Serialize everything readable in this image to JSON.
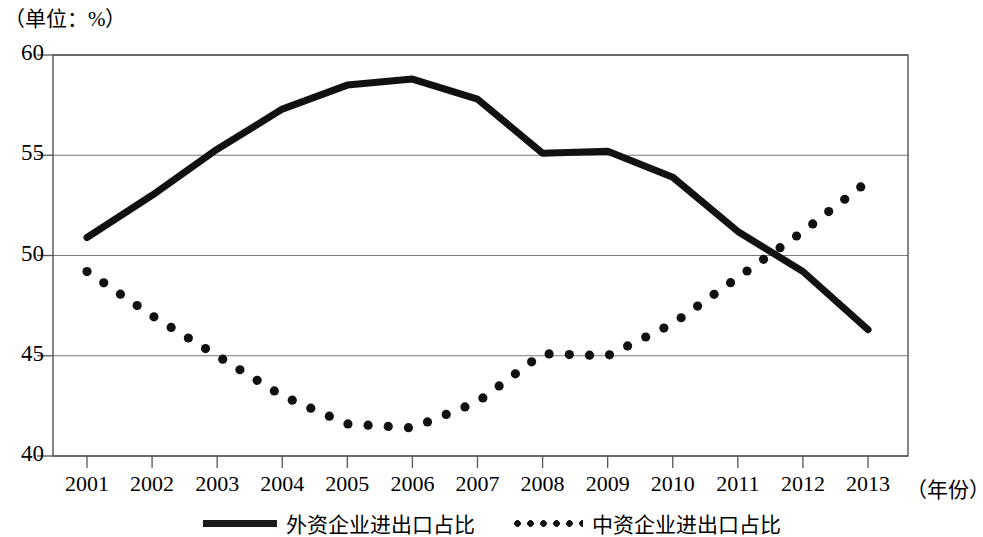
{
  "unit_note": "（单位：%）",
  "axis": {
    "x_name": "（年份）",
    "y_ticks": [
      "60",
      "55",
      "50",
      "45",
      "40"
    ],
    "x_ticks": [
      "2001",
      "2002",
      "2003",
      "2004",
      "2005",
      "2006",
      "2007",
      "2008",
      "2009",
      "2010",
      "2011",
      "2012",
      "2013"
    ]
  },
  "legend": {
    "items": [
      {
        "label": "外资企业进出口占比",
        "style": "solid"
      },
      {
        "label": "中资企业进出口占比",
        "style": "dotted"
      }
    ]
  },
  "colors": {
    "line": "#111111",
    "grid": "#7a7a7a",
    "axis": "#555555",
    "background": "#ffffff"
  },
  "chart_data": {
    "type": "line",
    "title": "",
    "subtitle": "",
    "xlabel": "（年份）",
    "ylabel": "（单位：%）",
    "xlim": [
      2001,
      2013
    ],
    "ylim": [
      40,
      60
    ],
    "yticks": [
      40,
      45,
      50,
      55,
      60
    ],
    "grid": true,
    "legend_position": "bottom-center",
    "x": [
      2001,
      2002,
      2003,
      2004,
      2005,
      2006,
      2007,
      2008,
      2009,
      2010,
      2011,
      2012,
      2013
    ],
    "categories": [
      "2001",
      "2002",
      "2003",
      "2004",
      "2005",
      "2006",
      "2007",
      "2008",
      "2009",
      "2010",
      "2011",
      "2012",
      "2013"
    ],
    "series": [
      {
        "name": "外资企业进出口占比",
        "style": "solid",
        "values": [
          50.9,
          53.0,
          55.3,
          57.3,
          58.5,
          58.8,
          57.8,
          55.1,
          55.2,
          53.9,
          51.2,
          49.2,
          46.3
        ]
      },
      {
        "name": "中资企业进出口占比",
        "style": "dotted",
        "values": [
          49.2,
          47.0,
          45.0,
          43.0,
          41.6,
          41.4,
          42.7,
          45.1,
          45.0,
          46.6,
          48.9,
          51.2,
          53.7
        ]
      }
    ]
  }
}
